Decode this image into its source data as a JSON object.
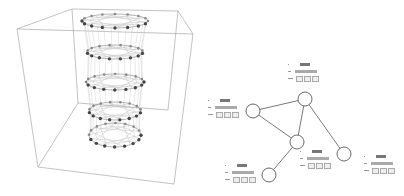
{
  "figure": {
    "left_panel": {
      "type": "3d-layered-network",
      "layers": 5,
      "box": {
        "top": [
          [
            17,
            29
          ],
          [
            72,
            9
          ],
          [
            178,
            11
          ],
          [
            193,
            34
          ]
        ],
        "bottom": [
          [
            38,
            167
          ],
          [
            78,
            103
          ],
          [
            168,
            110
          ],
          [
            174,
            184
          ]
        ]
      },
      "layer_ellipses": [
        {
          "cx": 115,
          "cy": 21,
          "rx": 33,
          "ry": 7
        },
        {
          "cx": 115,
          "cy": 52,
          "rx": 28,
          "ry": 7
        },
        {
          "cx": 115,
          "cy": 82,
          "rx": 29,
          "ry": 8
        },
        {
          "cx": 115,
          "cy": 111,
          "rx": 26,
          "ry": 9
        },
        {
          "cx": 115,
          "cy": 135,
          "rx": 26,
          "ry": 12
        }
      ]
    },
    "right_panel": {
      "type": "graph",
      "nodes": [
        {
          "id": "A",
          "x": 305,
          "y": 99,
          "r": 7
        },
        {
          "id": "B",
          "x": 253,
          "y": 111,
          "r": 7
        },
        {
          "id": "C",
          "x": 297,
          "y": 142,
          "r": 7
        },
        {
          "id": "D",
          "x": 269,
          "y": 175,
          "r": 7
        },
        {
          "id": "E",
          "x": 344,
          "y": 154,
          "r": 7
        }
      ],
      "edges": [
        [
          "A",
          "B"
        ],
        [
          "B",
          "C"
        ],
        [
          "A",
          "C"
        ],
        [
          "A",
          "E"
        ],
        [
          "C",
          "D"
        ]
      ],
      "labels": [
        {
          "node": "A",
          "x": 288,
          "y": 63
        },
        {
          "node": "B",
          "x": 208,
          "y": 99
        },
        {
          "node": "C",
          "x": 300,
          "y": 150
        },
        {
          "node": "D",
          "x": 225,
          "y": 164
        },
        {
          "node": "E",
          "x": 364,
          "y": 155
        }
      ]
    }
  }
}
